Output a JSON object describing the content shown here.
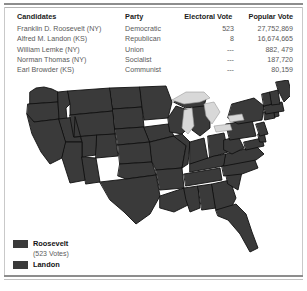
{
  "table": {
    "headers": {
      "candidates": "Candidates",
      "party": "Party",
      "electoral_vote": "Electoral Vote",
      "popular_vote": "Popular Vote"
    },
    "rows": [
      {
        "candidate": "Franklin D. Roosevelt (NY)",
        "party": "Democratic",
        "electoral_vote": "523",
        "popular_vote": "27,752,869"
      },
      {
        "candidate": "Alfred M. Landon (KS)",
        "party": "Republican",
        "electoral_vote": "8",
        "popular_vote": "16,674,665"
      },
      {
        "candidate": "William Lemke (NY)",
        "party": "Union",
        "electoral_vote": "---",
        "popular_vote": "882, 479"
      },
      {
        "candidate": "Norman Thomas (NY)",
        "party": "Socialist",
        "electoral_vote": "---",
        "popular_vote": "187,720"
      },
      {
        "candidate": "Earl Browder (KS)",
        "party": "Communist",
        "electoral_vote": "---",
        "popular_vote": "80,159"
      }
    ]
  },
  "legend": {
    "items": [
      {
        "label": "Roosevelt",
        "sublabel": "(523 Votes)",
        "color": "#3a3a3a"
      },
      {
        "label": "Landon",
        "sublabel": "",
        "color": "#3a3a3a"
      }
    ]
  },
  "map": {
    "title": "united-states-electoral-map-1936",
    "land_color": "#3a3a3a",
    "border_color": "#111111",
    "water_color": "#d8d8d8",
    "background": "#ffffff"
  }
}
